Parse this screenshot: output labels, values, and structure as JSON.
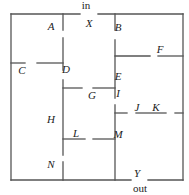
{
  "diagram": {
    "type": "maze",
    "entrance_label": "in",
    "exit_label": "out",
    "labels": [
      {
        "id": "X",
        "x": 89,
        "y": 27
      },
      {
        "id": "A",
        "x": 51,
        "y": 30
      },
      {
        "id": "B",
        "x": 118,
        "y": 31
      },
      {
        "id": "F",
        "x": 160,
        "y": 53
      },
      {
        "id": "C",
        "x": 22,
        "y": 74
      },
      {
        "id": "D",
        "x": 66,
        "y": 73
      },
      {
        "id": "E",
        "x": 118,
        "y": 80
      },
      {
        "id": "G",
        "x": 92,
        "y": 99
      },
      {
        "id": "I",
        "x": 118,
        "y": 97
      },
      {
        "id": "J",
        "x": 137,
        "y": 111
      },
      {
        "id": "K",
        "x": 156,
        "y": 111
      },
      {
        "id": "H",
        "x": 51,
        "y": 123
      },
      {
        "id": "L",
        "x": 76,
        "y": 137
      },
      {
        "id": "M",
        "x": 118,
        "y": 138
      },
      {
        "id": "N",
        "x": 51,
        "y": 168
      },
      {
        "id": "Y",
        "x": 137,
        "y": 177
      }
    ],
    "walls": [
      [
        11,
        14,
        80,
        14
      ],
      [
        98,
        14,
        183,
        14
      ],
      [
        11,
        14,
        11,
        180
      ],
      [
        183,
        14,
        183,
        180
      ],
      [
        11,
        180,
        131,
        180
      ],
      [
        148,
        180,
        183,
        180
      ],
      [
        63,
        14,
        63,
        30
      ],
      [
        63,
        38,
        63,
        70
      ],
      [
        63,
        80,
        63,
        155
      ],
      [
        63,
        162,
        63,
        180
      ],
      [
        11,
        63,
        25,
        63
      ],
      [
        37,
        63,
        63,
        63
      ],
      [
        115,
        14,
        115,
        30
      ],
      [
        115,
        40,
        115,
        98
      ],
      [
        115,
        105,
        115,
        180
      ],
      [
        115,
        56,
        150,
        56
      ],
      [
        158,
        56,
        183,
        56
      ],
      [
        63,
        88,
        82,
        88
      ],
      [
        93,
        88,
        115,
        88
      ],
      [
        115,
        113,
        127,
        113
      ],
      [
        136,
        113,
        166,
        113
      ],
      [
        175,
        113,
        183,
        113
      ],
      [
        63,
        139,
        85,
        139
      ],
      [
        93,
        139,
        115,
        139
      ]
    ]
  }
}
